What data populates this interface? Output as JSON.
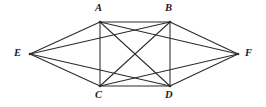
{
  "figure": {
    "background_color": "#ffffff",
    "edge_color": "#2b2b2b",
    "label_color": "#1a1a1a",
    "width": 266,
    "height": 107
  },
  "graph_data": {
    "type": "graph",
    "directed": false,
    "vertex_count": 6,
    "edge_count": 14,
    "vertices": [
      {
        "id": "A",
        "label": "A",
        "x": 100,
        "y": 22,
        "label_x": 95,
        "label_y": 3,
        "dot": true
      },
      {
        "id": "B",
        "label": "B",
        "x": 170,
        "y": 22,
        "label_x": 165,
        "label_y": 3,
        "dot": true
      },
      {
        "id": "C",
        "label": "C",
        "x": 100,
        "y": 86,
        "label_x": 95,
        "label_y": 90,
        "dot": true
      },
      {
        "id": "D",
        "label": "D",
        "x": 170,
        "y": 86,
        "label_x": 165,
        "label_y": 90,
        "dot": true
      },
      {
        "id": "E",
        "label": "E",
        "x": 30,
        "y": 54,
        "label_x": 14,
        "label_y": 48,
        "dot": true
      },
      {
        "id": "F",
        "label": "F",
        "x": 238,
        "y": 54,
        "label_x": 245,
        "label_y": 48,
        "dot": true
      }
    ],
    "edges": [
      {
        "from": "A",
        "to": "B"
      },
      {
        "from": "A",
        "to": "C"
      },
      {
        "from": "A",
        "to": "D"
      },
      {
        "from": "A",
        "to": "E"
      },
      {
        "from": "A",
        "to": "F"
      },
      {
        "from": "B",
        "to": "C"
      },
      {
        "from": "B",
        "to": "D"
      },
      {
        "from": "B",
        "to": "E"
      },
      {
        "from": "B",
        "to": "F"
      },
      {
        "from": "C",
        "to": "D"
      },
      {
        "from": "C",
        "to": "E"
      },
      {
        "from": "C",
        "to": "F"
      },
      {
        "from": "D",
        "to": "E"
      },
      {
        "from": "D",
        "to": "F"
      }
    ],
    "missing_edges": [
      {
        "from": "E",
        "to": "F"
      }
    ]
  }
}
